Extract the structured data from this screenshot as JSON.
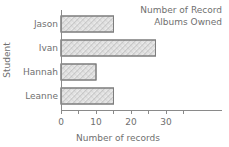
{
  "chart_data": {
    "type": "bar",
    "orientation": "horizontal",
    "title": "Number of Record Albums Owned",
    "title_lines": [
      "Number of Record",
      "Albums Owned"
    ],
    "title_position": "top-right",
    "categories": [
      "Jason",
      "Ivan",
      "Hannah",
      "Leanne"
    ],
    "values": [
      15,
      27,
      10,
      15
    ],
    "xlabel": "Number of records",
    "ylabel": "Student",
    "xlim": [
      0,
      35
    ],
    "ylim": null,
    "x_major_ticks": [
      0,
      10,
      20,
      30
    ],
    "x_minor_ticks": [
      5,
      15,
      25,
      35
    ],
    "x_tick_labels": [
      "0",
      "10",
      "20",
      "30"
    ],
    "grid": false,
    "legend": null,
    "bar_fill": "#e8e8e8",
    "bar_hatch": "crosshatch",
    "bar_edge_color": "#7d7d7d",
    "axis_color": "#8a8a8a",
    "text_color": "#6f6f6f",
    "background": "#ffffff"
  },
  "icons": {
    "hatch_swatch": "hatch-pattern-icon"
  }
}
